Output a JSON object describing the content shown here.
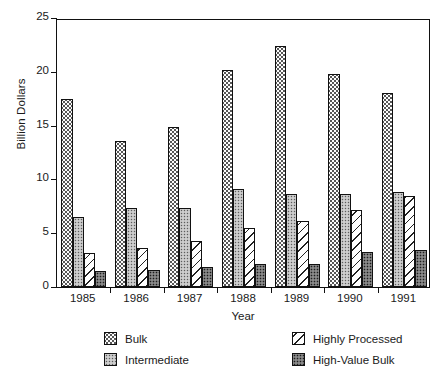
{
  "chart_data": {
    "type": "bar",
    "title": "",
    "xlabel": "Year",
    "ylabel": "Billion Dollars",
    "categories": [
      "1985",
      "1986",
      "1987",
      "1988",
      "1989",
      "1990",
      "1991"
    ],
    "ylim": [
      0,
      25
    ],
    "yticks": [
      0,
      5,
      10,
      15,
      20,
      25
    ],
    "grid": false,
    "legend_position": "below-axes",
    "series": [
      {
        "name": "Bulk",
        "pattern": "sparse-dots",
        "color": "#fdfdfd",
        "values": [
          17.5,
          13.6,
          14.9,
          20.2,
          22.4,
          19.8,
          18.0
        ]
      },
      {
        "name": "Intermediate",
        "pattern": "gray-dots",
        "color": "#bdbdbd",
        "values": [
          6.5,
          7.3,
          7.3,
          9.1,
          8.6,
          8.6,
          8.8
        ]
      },
      {
        "name": "Highly Processed",
        "pattern": "diagonal-hatch",
        "color": "#ffffff",
        "values": [
          3.2,
          3.6,
          4.3,
          5.5,
          6.1,
          7.2,
          8.5
        ]
      },
      {
        "name": "High-Value Bulk",
        "pattern": "dense-dark",
        "color": "#6e6e6e",
        "values": [
          1.5,
          1.6,
          1.9,
          2.1,
          2.1,
          3.3,
          3.4
        ]
      }
    ]
  },
  "axis": {
    "ylabel": "Billion Dollars",
    "xlabel": "Year"
  },
  "legend": {
    "left": [
      {
        "label": "Bulk",
        "pattern": "p-bulk"
      },
      {
        "label": "Intermediate",
        "pattern": "p-inter"
      }
    ],
    "right": [
      {
        "label": "Highly Processed",
        "pattern": "p-hp"
      },
      {
        "label": "High-Value Bulk",
        "pattern": "p-hvb"
      }
    ]
  }
}
